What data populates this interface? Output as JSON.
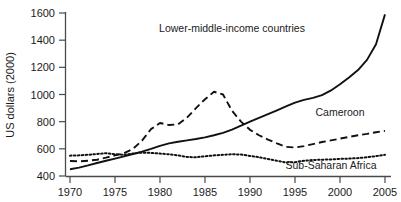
{
  "chart_data": {
    "type": "line",
    "title": "",
    "xlabel": "",
    "ylabel": "US dollars (2000)",
    "xlim": [
      1970,
      2005
    ],
    "ylim": [
      400,
      1600
    ],
    "grid": false,
    "legend_position": "inline-annotations",
    "x_ticks": [
      "1970",
      "1975",
      "1980",
      "1985",
      "1990",
      "1995",
      "2000",
      "2005"
    ],
    "y_ticks": [
      "400",
      "600",
      "800",
      "1000",
      "1200",
      "1400",
      "1600"
    ],
    "series": [
      {
        "name": "Lower-middle-income countries",
        "style": "solid",
        "color": "#111111",
        "label_x": 1988,
        "label_y": 1460,
        "x": [
          1970,
          1971,
          1972,
          1973,
          1974,
          1975,
          1976,
          1977,
          1978,
          1979,
          1980,
          1981,
          1982,
          1983,
          1984,
          1985,
          1986,
          1987,
          1988,
          1989,
          1990,
          1991,
          1992,
          1993,
          1994,
          1995,
          1996,
          1997,
          1998,
          1999,
          2000,
          2001,
          2002,
          2003,
          2004,
          2005
        ],
        "values": [
          450,
          462,
          478,
          496,
          512,
          528,
          545,
          562,
          580,
          600,
          622,
          640,
          652,
          662,
          672,
          684,
          700,
          718,
          742,
          770,
          800,
          828,
          856,
          884,
          912,
          940,
          960,
          975,
          995,
          1030,
          1075,
          1125,
          1180,
          1255,
          1370,
          1590
        ]
      },
      {
        "name": "Cameroon",
        "style": "dashed",
        "color": "#111111",
        "label_x": 2000,
        "label_y": 845,
        "x": [
          1970,
          1971,
          1972,
          1973,
          1974,
          1975,
          1976,
          1977,
          1978,
          1979,
          1980,
          1981,
          1982,
          1983,
          1984,
          1985,
          1986,
          1987,
          1988,
          1989,
          1990,
          1991,
          1992,
          1993,
          1994,
          1995,
          1996,
          1997,
          1998,
          1999,
          2000,
          2001,
          2002,
          2003,
          2004,
          2005
        ],
        "values": [
          510,
          508,
          512,
          520,
          535,
          552,
          568,
          600,
          660,
          745,
          790,
          775,
          780,
          830,
          900,
          965,
          1020,
          1000,
          880,
          800,
          740,
          700,
          668,
          640,
          615,
          610,
          620,
          635,
          650,
          662,
          675,
          688,
          700,
          710,
          722,
          732
        ]
      },
      {
        "name": "Sub-Saharan Africa",
        "style": "dotted",
        "color": "#111111",
        "label_x": 1999,
        "label_y": 452,
        "x": [
          1970,
          1971,
          1972,
          1973,
          1974,
          1975,
          1976,
          1977,
          1978,
          1979,
          1980,
          1981,
          1982,
          1983,
          1984,
          1985,
          1986,
          1987,
          1988,
          1989,
          1990,
          1991,
          1992,
          1993,
          1994,
          1995,
          1996,
          1997,
          1998,
          1999,
          2000,
          2001,
          2002,
          2003,
          2004,
          2005
        ],
        "values": [
          550,
          552,
          556,
          562,
          568,
          560,
          556,
          565,
          572,
          570,
          565,
          560,
          552,
          540,
          538,
          545,
          552,
          556,
          560,
          558,
          548,
          538,
          525,
          512,
          500,
          502,
          512,
          518,
          520,
          522,
          526,
          528,
          532,
          538,
          546,
          556
        ]
      }
    ]
  }
}
